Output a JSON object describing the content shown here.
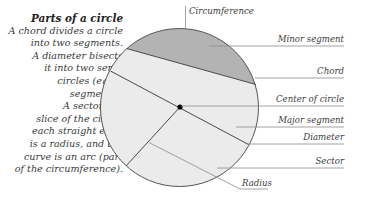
{
  "intro": {
    "title": "Parts of a circle",
    "lines": [
      "A chord divides a circle",
      "into two segments.",
      "A diameter bisects",
      "it into two semi-",
      "circles (equal",
      "segments).",
      "A sector is a",
      "slice of the circle;",
      "each straight edge",
      "is a radius, and the",
      "curve is an arc (part",
      "of the circumference)."
    ]
  },
  "labels": {
    "circumference": "Circumference",
    "minor_segment": "Minor segment",
    "chord": "Chord",
    "center_of_circle": "Center of circle",
    "major_segment": "Major segment",
    "diameter": "Diameter",
    "sector": "Sector",
    "radius": "Radius"
  },
  "colors": {
    "minor_segment_fill": "#b3b3b3",
    "major_segment_fill": "#ebebeb",
    "outline": "#555555",
    "leader": "#8a8a8a",
    "center_dot": "#000000"
  }
}
